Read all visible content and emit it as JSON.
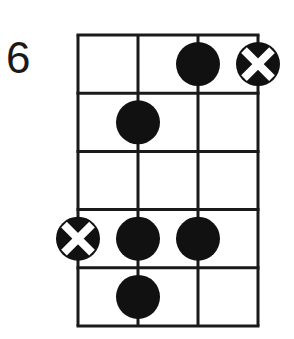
{
  "diagram": {
    "type": "chord-diagram",
    "fret_label": "6",
    "strings": 4,
    "frets": 5,
    "colors": {
      "line": "#1a1a1a",
      "dot": "#111111",
      "x_mark": "#ffffff"
    },
    "markers": [
      {
        "fret": 1,
        "string": 3,
        "kind": "dot"
      },
      {
        "fret": 1,
        "string": 4,
        "kind": "x-dot"
      },
      {
        "fret": 2,
        "string": 2,
        "kind": "dot"
      },
      {
        "fret": 4,
        "string": 1,
        "kind": "x-dot"
      },
      {
        "fret": 4,
        "string": 2,
        "kind": "dot"
      },
      {
        "fret": 4,
        "string": 3,
        "kind": "dot"
      },
      {
        "fret": 5,
        "string": 2,
        "kind": "dot"
      }
    ]
  }
}
